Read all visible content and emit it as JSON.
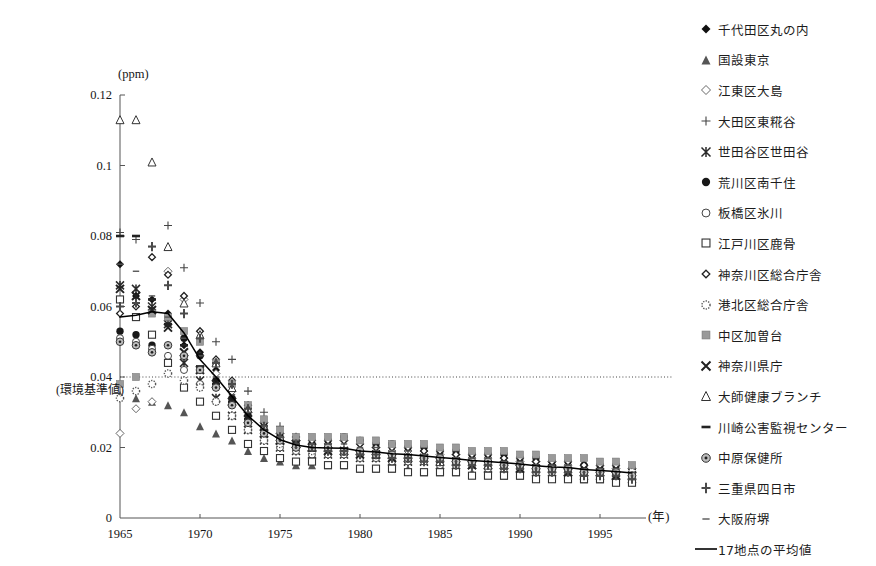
{
  "chart": {
    "unit_label": "(ppm)",
    "x_axis_label": "(年)",
    "standard_annotation": "(環境基準値)"
  },
  "chart_data": {
    "type": "scatter",
    "title": "",
    "xlabel": "(年)",
    "ylabel": "(ppm)",
    "xlim": [
      1965,
      1997
    ],
    "ylim": [
      0,
      0.12
    ],
    "yticks": [
      "0",
      "0.02",
      "0.04",
      "0.06",
      "0.08",
      "0.1",
      "0.12"
    ],
    "ytick_values": [
      0,
      0.02,
      0.04,
      0.06,
      0.08,
      0.1,
      0.12
    ],
    "xticks": [
      "1965",
      "1970",
      "1975",
      "1980",
      "1985",
      "1990",
      "1995"
    ],
    "xtick_values": [
      1965,
      1970,
      1975,
      1980,
      1985,
      1990,
      1995
    ],
    "grid": false,
    "legend_position": "right",
    "annotations": [
      {
        "text": "(環境基準値)",
        "y": 0.04,
        "note": "dotted horizontal reference line at 0.04 ppm"
      }
    ],
    "reference_lines": [
      {
        "y": 0.04,
        "style": "dotted",
        "label": "(環境基準値)"
      }
    ],
    "x": [
      1965,
      1966,
      1967,
      1968,
      1969,
      1970,
      1971,
      1972,
      1973,
      1974,
      1975,
      1976,
      1977,
      1978,
      1979,
      1980,
      1981,
      1982,
      1983,
      1984,
      1985,
      1986,
      1987,
      1988,
      1989,
      1990,
      1991,
      1992,
      1993,
      1994,
      1995,
      1996,
      1997
    ],
    "series": [
      {
        "name": "千代田区丸の内",
        "marker": "filled-diamond",
        "values": [
          0.072,
          0.063,
          0.062,
          0.058,
          0.049,
          0.047,
          0.042,
          0.038,
          0.031,
          0.026,
          0.023,
          0.021,
          0.02,
          0.02,
          0.019,
          0.018,
          0.018,
          0.018,
          0.017,
          0.017,
          0.017,
          0.016,
          0.016,
          0.016,
          0.016,
          0.016,
          0.015,
          0.015,
          0.015,
          0.014,
          0.014,
          0.014,
          0.013
        ]
      },
      {
        "name": "国設東京",
        "marker": "filled-triangle",
        "values": [
          0.035,
          0.034,
          0.033,
          0.032,
          0.03,
          0.026,
          0.024,
          0.022,
          0.019,
          0.017,
          0.016,
          0.015,
          0.015,
          0.015,
          0.015,
          0.014,
          0.014,
          0.014,
          0.014,
          0.013,
          0.013,
          0.013,
          0.013,
          0.013,
          0.012,
          0.012,
          0.012,
          0.012,
          0.012,
          0.011,
          0.011,
          0.011,
          0.011
        ]
      },
      {
        "name": "江東区大島",
        "marker": "open-diamond",
        "values": [
          0.024,
          0.031,
          0.033,
          0.07,
          0.062,
          0.046,
          0.041,
          0.036,
          0.03,
          0.027,
          0.024,
          0.022,
          0.021,
          0.021,
          0.022,
          0.021,
          0.02,
          0.019,
          0.019,
          0.019,
          0.018,
          0.018,
          0.017,
          0.017,
          0.017,
          0.016,
          0.016,
          0.016,
          0.015,
          0.015,
          0.015,
          0.014,
          0.014
        ]
      },
      {
        "name": "大田区東糀谷",
        "marker": "plus",
        "values": [
          0.081,
          0.079,
          0.077,
          0.083,
          0.071,
          0.061,
          0.05,
          0.045,
          0.036,
          0.03,
          0.026,
          0.023,
          0.022,
          0.021,
          0.02,
          0.019,
          0.019,
          0.018,
          0.018,
          0.017,
          0.017,
          0.017,
          0.016,
          0.016,
          0.016,
          0.015,
          0.015,
          0.015,
          0.014,
          0.014,
          0.013,
          0.013,
          0.013
        ]
      },
      {
        "name": "世田谷区世田谷",
        "marker": "star-x",
        "values": [
          0.066,
          0.065,
          0.06,
          0.055,
          0.044,
          0.039,
          0.034,
          0.029,
          0.025,
          0.022,
          0.02,
          0.019,
          0.018,
          0.018,
          0.018,
          0.017,
          0.017,
          0.016,
          0.016,
          0.016,
          0.015,
          0.015,
          0.015,
          0.014,
          0.014,
          0.014,
          0.013,
          0.013,
          0.013,
          0.012,
          0.012,
          0.012,
          0.011
        ]
      },
      {
        "name": "荒川区南千住",
        "marker": "filled-circle",
        "values": [
          0.053,
          0.052,
          0.049,
          0.057,
          0.051,
          0.046,
          0.039,
          0.034,
          0.029,
          0.026,
          0.023,
          0.021,
          0.021,
          0.022,
          0.023,
          0.022,
          0.021,
          0.021,
          0.02,
          0.02,
          0.019,
          0.019,
          0.018,
          0.018,
          0.018,
          0.017,
          0.017,
          0.016,
          0.016,
          0.015,
          0.015,
          0.015,
          0.014
        ]
      },
      {
        "name": "板橋区氷川",
        "marker": "open-circle",
        "values": [
          0.051,
          0.05,
          0.048,
          0.046,
          0.042,
          0.038,
          0.033,
          0.029,
          0.025,
          0.022,
          0.02,
          0.019,
          0.018,
          0.018,
          0.018,
          0.017,
          0.017,
          0.016,
          0.016,
          0.016,
          0.015,
          0.015,
          0.015,
          0.014,
          0.014,
          0.014,
          0.013,
          0.013,
          0.013,
          0.012,
          0.012,
          0.012,
          0.012
        ]
      },
      {
        "name": "江戸川区鹿骨",
        "marker": "open-square",
        "values": [
          0.062,
          0.057,
          0.052,
          0.044,
          0.037,
          0.033,
          0.029,
          0.025,
          0.021,
          0.019,
          0.017,
          0.016,
          0.016,
          0.015,
          0.015,
          0.014,
          0.014,
          0.014,
          0.013,
          0.013,
          0.013,
          0.013,
          0.012,
          0.012,
          0.012,
          0.012,
          0.011,
          0.011,
          0.011,
          0.011,
          0.011,
          0.01,
          0.01
        ]
      },
      {
        "name": "神奈川区総合庁舎",
        "marker": "open-diamond-sm",
        "values": [
          0.058,
          0.06,
          0.074,
          0.069,
          0.063,
          0.053,
          0.045,
          0.039,
          0.032,
          0.027,
          0.024,
          0.023,
          0.022,
          0.022,
          0.022,
          0.021,
          0.02,
          0.02,
          0.02,
          0.019,
          0.019,
          0.018,
          0.018,
          0.018,
          0.017,
          0.017,
          0.016,
          0.016,
          0.016,
          0.015,
          0.015,
          0.015,
          0.014
        ]
      },
      {
        "name": "港北区総合庁舎",
        "marker": "dotted-circle",
        "values": [
          0.034,
          0.036,
          0.038,
          0.041,
          0.039,
          0.037,
          0.033,
          0.029,
          0.025,
          0.022,
          0.021,
          0.02,
          0.019,
          0.019,
          0.019,
          0.018,
          0.018,
          0.017,
          0.017,
          0.017,
          0.016,
          0.016,
          0.016,
          0.015,
          0.015,
          0.015,
          0.014,
          0.014,
          0.014,
          0.013,
          0.013,
          0.013,
          0.013
        ]
      },
      {
        "name": "中区加曽台",
        "marker": "filled-square",
        "values": [
          0.038,
          0.04,
          0.058,
          0.057,
          0.053,
          0.05,
          0.044,
          0.038,
          0.032,
          0.028,
          0.025,
          0.023,
          0.023,
          0.023,
          0.023,
          0.022,
          0.022,
          0.021,
          0.021,
          0.021,
          0.02,
          0.02,
          0.019,
          0.019,
          0.019,
          0.018,
          0.018,
          0.017,
          0.017,
          0.017,
          0.016,
          0.016,
          0.015
        ]
      },
      {
        "name": "神奈川県庁",
        "marker": "bold-x",
        "values": [
          0.065,
          0.063,
          0.059,
          0.054,
          0.047,
          0.042,
          0.038,
          0.033,
          0.028,
          0.024,
          0.022,
          0.021,
          0.02,
          0.019,
          0.019,
          0.018,
          0.018,
          0.017,
          0.017,
          0.017,
          0.016,
          0.016,
          0.015,
          0.015,
          0.015,
          0.014,
          0.014,
          0.014,
          0.013,
          0.013,
          0.013,
          0.012,
          0.012
        ]
      },
      {
        "name": "大師健康ブランチ",
        "marker": "open-triangle",
        "values": [
          0.113,
          0.113,
          0.101,
          0.077,
          0.061,
          0.052,
          0.044,
          0.037,
          0.031,
          0.026,
          0.023,
          0.021,
          0.02,
          0.02,
          0.019,
          0.019,
          0.018,
          0.018,
          0.017,
          0.017,
          0.016,
          0.016,
          0.016,
          0.015,
          0.015,
          0.015,
          0.014,
          0.014,
          0.014,
          0.013,
          0.013,
          0.013,
          0.012
        ]
      },
      {
        "name": "川崎公害監視センター",
        "marker": "dash-thick",
        "values": [
          0.08,
          0.08,
          0.062,
          0.055,
          0.049,
          0.043,
          0.038,
          0.033,
          0.028,
          0.025,
          0.022,
          0.021,
          0.02,
          0.02,
          0.019,
          0.019,
          0.018,
          0.018,
          0.017,
          0.017,
          0.016,
          0.016,
          0.016,
          0.015,
          0.015,
          0.015,
          0.014,
          0.014,
          0.014,
          0.013,
          0.013,
          0.012,
          0.012
        ]
      },
      {
        "name": "中原保健所",
        "marker": "bullseye",
        "values": [
          0.05,
          0.049,
          0.047,
          0.049,
          0.046,
          0.042,
          0.037,
          0.032,
          0.027,
          0.024,
          0.022,
          0.02,
          0.02,
          0.02,
          0.019,
          0.019,
          0.018,
          0.018,
          0.017,
          0.017,
          0.017,
          0.016,
          0.016,
          0.016,
          0.015,
          0.015,
          0.014,
          0.014,
          0.014,
          0.013,
          0.013,
          0.013,
          0.012
        ]
      },
      {
        "name": "三重県四日市",
        "marker": "plus-bold",
        "values": [
          0.06,
          0.061,
          0.077,
          0.066,
          0.058,
          0.051,
          0.044,
          0.038,
          0.031,
          0.026,
          0.023,
          0.021,
          0.02,
          0.019,
          0.019,
          0.018,
          0.018,
          0.017,
          0.017,
          0.016,
          0.016,
          0.015,
          0.015,
          0.015,
          0.014,
          0.014,
          0.013,
          0.013,
          0.013,
          0.012,
          0.012,
          0.012,
          0.011
        ]
      },
      {
        "name": "大阪府堺",
        "marker": "dash-thin",
        "values": [
          0.072,
          0.07,
          0.063,
          0.057,
          0.051,
          0.046,
          0.04,
          0.035,
          0.03,
          0.026,
          0.023,
          0.022,
          0.021,
          0.021,
          0.021,
          0.02,
          0.02,
          0.019,
          0.019,
          0.018,
          0.018,
          0.017,
          0.017,
          0.017,
          0.016,
          0.016,
          0.015,
          0.015,
          0.015,
          0.014,
          0.014,
          0.014,
          0.013
        ]
      }
    ],
    "average_line": {
      "name": "17地点の平均値",
      "values": [
        0.057,
        0.0575,
        0.0585,
        0.058,
        0.0525,
        0.045,
        0.04,
        0.0345,
        0.029,
        0.025,
        0.0222,
        0.0207,
        0.02,
        0.0199,
        0.0198,
        0.019,
        0.0187,
        0.0182,
        0.018,
        0.0176,
        0.0172,
        0.0168,
        0.0163,
        0.016,
        0.0157,
        0.0153,
        0.0148,
        0.0145,
        0.0143,
        0.0138,
        0.0135,
        0.0132,
        0.0128
      ]
    }
  },
  "legend": {
    "items": [
      {
        "label": "千代田区丸の内",
        "marker": "filled-diamond"
      },
      {
        "label": "国設東京",
        "marker": "filled-triangle"
      },
      {
        "label": "江東区大島",
        "marker": "open-diamond"
      },
      {
        "label": "大田区東糀谷",
        "marker": "plus"
      },
      {
        "label": "世田谷区世田谷",
        "marker": "star-x"
      },
      {
        "label": "荒川区南千住",
        "marker": "filled-circle"
      },
      {
        "label": "板橋区氷川",
        "marker": "open-circle"
      },
      {
        "label": "江戸川区鹿骨",
        "marker": "open-square"
      },
      {
        "label": "神奈川区総合庁舎",
        "marker": "open-diamond-sm"
      },
      {
        "label": "港北区総合庁舎",
        "marker": "dotted-circle"
      },
      {
        "label": "中区加曽台",
        "marker": "filled-square"
      },
      {
        "label": "神奈川県庁",
        "marker": "bold-x"
      },
      {
        "label": "大師健康ブランチ",
        "marker": "open-triangle"
      },
      {
        "label": "川崎公害監視センター",
        "marker": "dash-thick"
      },
      {
        "label": "中原保健所",
        "marker": "bullseye"
      },
      {
        "label": "三重県四日市",
        "marker": "plus-bold"
      },
      {
        "label": "大阪府堺",
        "marker": "dash-thin"
      },
      {
        "label": "17地点の平均値",
        "marker": "line"
      }
    ]
  },
  "colors": {
    "axis": "#555555",
    "text": "#1a1a1a",
    "average_line": "#000000",
    "standard_line": "#444444"
  }
}
